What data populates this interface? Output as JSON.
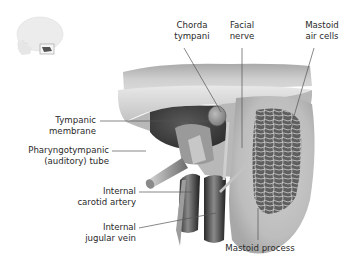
{
  "figure": {
    "type": "anatomical-illustration",
    "orientation_thumbnail": "skull-lateral-with-highlight-box"
  },
  "labels": {
    "chorda_tympani": {
      "line1": "Chorda",
      "line2": "tympani"
    },
    "facial_nerve": {
      "line1": "Facial",
      "line2": "nerve"
    },
    "mastoid_air_cells": {
      "line1": "Mastoid",
      "line2": "air cells"
    },
    "tympanic_membrane": {
      "line1": "Tympanic",
      "line2": "membrane"
    },
    "pharyngotympanic_tube": {
      "line1": "Pharyngotympanic",
      "line2": "(auditory) tube"
    },
    "internal_carotid_artery": {
      "line1": "Internal",
      "line2": "carotid artery"
    },
    "internal_jugular_vein": {
      "line1": "Internal",
      "line2": "jugular vein"
    },
    "mastoid_process": {
      "line1": "Mastoid process"
    }
  },
  "colors": {
    "bone_light": "#e2e2e2",
    "bone_mid": "#bdbdbd",
    "bone_dark": "#7a7a7a",
    "shadow": "#3c3c3c",
    "leader_line": "#555555",
    "text": "#2a2a2a"
  }
}
